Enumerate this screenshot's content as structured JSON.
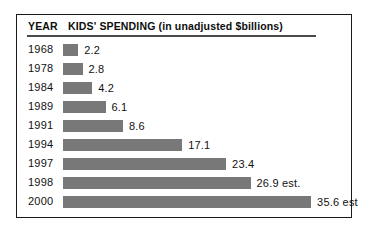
{
  "header": {
    "year_label": "YEAR",
    "spending_label": "KIDS' SPENDING (in unadjusted $billions)"
  },
  "chart_data": {
    "type": "bar",
    "title": "KIDS' SPENDING (in unadjusted $billions)",
    "xlabel": "",
    "ylabel": "YEAR",
    "orientation": "horizontal",
    "grid": false,
    "legend": "none",
    "xlim": [
      0,
      35.6
    ],
    "categories": [
      "1968",
      "1978",
      "1984",
      "1989",
      "1991",
      "1994",
      "1997",
      "1998",
      "2000"
    ],
    "values": [
      2.2,
      2.8,
      4.2,
      6.1,
      8.6,
      17.1,
      23.4,
      26.9,
      35.6
    ],
    "value_labels": [
      "2.2",
      "2.8",
      "4.2",
      "6.1",
      "8.6",
      "17.1",
      "23.4",
      "26.9 est.",
      "35.6 est"
    ],
    "bar_color": "#787878",
    "rows": [
      {
        "year": "1968",
        "value": 2.2,
        "label": "2.2"
      },
      {
        "year": "1978",
        "value": 2.8,
        "label": "2.8"
      },
      {
        "year": "1984",
        "value": 4.2,
        "label": "4.2"
      },
      {
        "year": "1989",
        "value": 6.1,
        "label": "6.1"
      },
      {
        "year": "1991",
        "value": 8.6,
        "label": "8.6"
      },
      {
        "year": "1994",
        "value": 17.1,
        "label": "17.1"
      },
      {
        "year": "1997",
        "value": 23.4,
        "label": "23.4"
      },
      {
        "year": "1998",
        "value": 26.9,
        "label": "26.9 est."
      },
      {
        "year": "2000",
        "value": 35.6,
        "label": "35.6 est"
      }
    ]
  },
  "style": {
    "frame_color": "#1a1a1a",
    "bar_color": "#787878",
    "text_color": "#111111",
    "px_per_unit": 6.97
  }
}
